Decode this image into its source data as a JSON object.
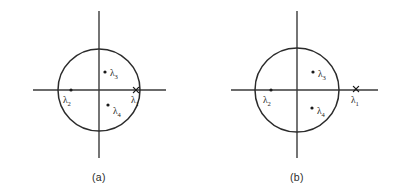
{
  "figure": {
    "background_color": "#ffffff",
    "line_color": "#2b2b2b",
    "axis_color": "#3a3a3a",
    "marker_color": "#1a1a1a",
    "width": 397,
    "height": 196
  },
  "chart_data": {
    "type": "scatter",
    "title": "",
    "xlabel": "",
    "ylabel": "",
    "grid": false,
    "legend": false,
    "panels": [
      {
        "id": "a",
        "caption": "(a)",
        "caption_x": 99,
        "caption_y": 181,
        "center": [
          99,
          90
        ],
        "radius": 41,
        "axes": {
          "horizontal": {
            "x1": 33,
            "x2": 166,
            "y": 90
          },
          "vertical": {
            "x": 99,
            "y1": 11,
            "y2": 158
          }
        },
        "points": [
          {
            "name": "lambda-1",
            "label": "λ",
            "subscript": "1",
            "marker": "cross",
            "x": 136,
            "y": 90,
            "label_x": 131,
            "label_y": 103,
            "position_note": "on the unit circle, on positive real axis"
          },
          {
            "name": "lambda-2",
            "label": "λ",
            "subscript": "2",
            "marker": "dot",
            "x": 71,
            "y": 90,
            "label_x": 63,
            "label_y": 103,
            "position_note": "inside circle, on negative real axis"
          },
          {
            "name": "lambda-3",
            "label": "λ",
            "subscript": "3",
            "marker": "dot",
            "x": 105,
            "y": 72,
            "label_x": 110,
            "label_y": 76,
            "position_note": "inside circle, upper right quadrant"
          },
          {
            "name": "lambda-4",
            "label": "λ",
            "subscript": "4",
            "marker": "dot",
            "x": 108,
            "y": 105,
            "label_x": 113,
            "label_y": 114,
            "position_note": "inside circle, lower right quadrant"
          }
        ]
      },
      {
        "id": "b",
        "caption": "(b)",
        "caption_x": 297,
        "caption_y": 181,
        "center": [
          297,
          90
        ],
        "radius": 42,
        "axes": {
          "horizontal": {
            "x1": 231,
            "x2": 378,
            "y": 90
          },
          "vertical": {
            "x": 297,
            "y1": 11,
            "y2": 158
          }
        },
        "points": [
          {
            "name": "lambda-1",
            "label": "λ",
            "subscript": "1",
            "marker": "cross",
            "x": 356,
            "y": 89,
            "label_x": 351,
            "label_y": 103,
            "position_note": "outside the unit circle, on positive real axis"
          },
          {
            "name": "lambda-2",
            "label": "λ",
            "subscript": "2",
            "marker": "dot",
            "x": 271,
            "y": 90,
            "label_x": 263,
            "label_y": 103,
            "position_note": "inside circle, on negative real axis"
          },
          {
            "name": "lambda-3",
            "label": "λ",
            "subscript": "3",
            "marker": "dot",
            "x": 313,
            "y": 72,
            "label_x": 318,
            "label_y": 77,
            "position_note": "inside circle, upper right quadrant"
          },
          {
            "name": "lambda-4",
            "label": "λ",
            "subscript": "4",
            "marker": "dot",
            "x": 312,
            "y": 108,
            "label_x": 317,
            "label_y": 114,
            "position_note": "inside circle, lower right quadrant"
          }
        ]
      }
    ]
  }
}
